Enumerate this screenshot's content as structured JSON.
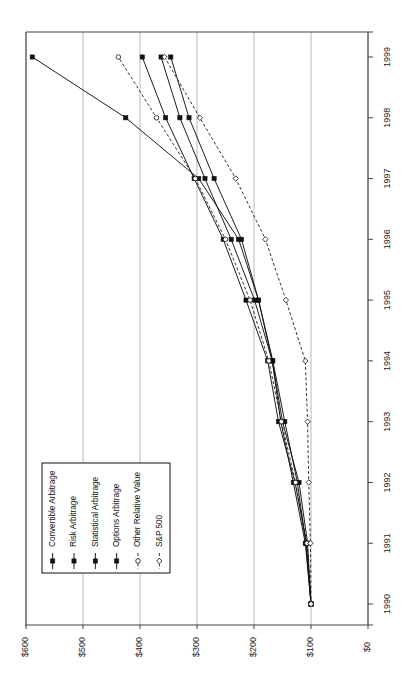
{
  "chart_data": {
    "type": "line",
    "title": "",
    "subtitle": "",
    "xlabel": "",
    "ylabel": "",
    "orientation": "rotated-90-ccw",
    "grid": true,
    "legend_position": "lower-left",
    "x": [
      "1990",
      "1991",
      "1992",
      "1993",
      "1994",
      "1995",
      "1996",
      "1997",
      "1998",
      "1999"
    ],
    "xtick_labels": [
      "1990",
      "1991",
      "1992",
      "1993",
      "1994",
      "1995",
      "1996",
      "1997",
      "1998",
      "1999"
    ],
    "ytick_labels": [
      "$0",
      "$100",
      "$200",
      "$300",
      "$400",
      "$500",
      "$600"
    ],
    "ytick_values": [
      0,
      100,
      200,
      300,
      400,
      500,
      600
    ],
    "ylim": [
      0,
      620
    ],
    "series": [
      {
        "name": "Convertible Arbitrage",
        "marker": "filled-square",
        "line": "solid",
        "values": [
          100,
          110,
          131,
          153,
          168,
          192,
          227,
          297,
          425,
          589
        ]
      },
      {
        "name": "Risk Arbitrage",
        "marker": "filled-square",
        "line": "solid",
        "values": [
          100,
          108,
          128,
          157,
          176,
          214,
          254,
          305,
          355,
          396
        ]
      },
      {
        "name": "Statistical Arbitrage",
        "marker": "filled-square",
        "line": "solid",
        "values": [
          100,
          106,
          121,
          150,
          168,
          199,
          240,
          286,
          330,
          363
        ]
      },
      {
        "name": "Options Arbitrage",
        "marker": "filled-square",
        "line": "solid",
        "values": [
          100,
          109,
          124,
          146,
          167,
          192,
          222,
          270,
          314,
          346
        ]
      },
      {
        "name": "Other Relative Value",
        "marker": "open-circle",
        "line": "dashed",
        "values": [
          100,
          107,
          127,
          152,
          174,
          207,
          250,
          303,
          371,
          438
        ]
      },
      {
        "name": "S&P 500",
        "marker": "open-diamond",
        "line": "dashed",
        "values": [
          100,
          101,
          104,
          106,
          110,
          144,
          180,
          232,
          295,
          357
        ]
      }
    ]
  },
  "legend": {
    "entries": [
      "Convertible Arbitrage",
      "Risk Arbitrage",
      "Statistical Arbitrage",
      "Options Arbitrage",
      "Other Relative Value",
      "S&P 500"
    ]
  },
  "colors": {
    "ink": "#111111",
    "grid": "#9a9a9a",
    "axis": "#444444",
    "background": "#ffffff"
  }
}
